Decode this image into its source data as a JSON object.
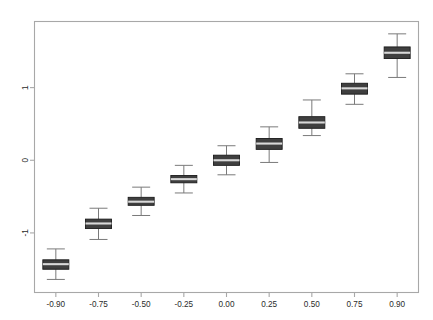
{
  "chart_data": {
    "type": "box",
    "title": "",
    "xlabel": "",
    "ylabel": "",
    "categories": [
      "-0.90",
      "-0.75",
      "-0.50",
      "-0.25",
      "0.00",
      "0.25",
      "0.50",
      "0.75",
      "0.90"
    ],
    "x_tick_labels": [
      "-0.90",
      "-0.75",
      "-0.50",
      "-0.25",
      "0.00",
      "0.25",
      "0.50",
      "0.75",
      "0.90"
    ],
    "y_tick_labels": [
      "1",
      "0",
      "-1"
    ],
    "y_ticks": [
      1,
      0,
      -1
    ],
    "ylim": [
      -1.82,
      1.91
    ],
    "grid": false,
    "legend": false,
    "box_fill": "#3f3f3f",
    "box_edge": "#1a1a1a",
    "median_color": "#d9d9d9",
    "whisker_color": "#7a7a7a",
    "frame_color": "#a8a8a8",
    "background": "#ffffff",
    "boxes": [
      {
        "category": "-0.90",
        "whisker_low": -1.64,
        "q1": -1.5,
        "median": -1.43,
        "q3": -1.37,
        "whisker_high": -1.22
      },
      {
        "category": "-0.75",
        "whisker_low": -1.09,
        "q1": -0.94,
        "median": -0.87,
        "q3": -0.81,
        "whisker_high": -0.66
      },
      {
        "category": "-0.50",
        "whisker_low": -0.76,
        "q1": -0.62,
        "median": -0.57,
        "q3": -0.51,
        "whisker_high": -0.37
      },
      {
        "category": "-0.25",
        "whisker_low": -0.45,
        "q1": -0.31,
        "median": -0.26,
        "q3": -0.21,
        "whisker_high": -0.07
      },
      {
        "category": "0.00",
        "whisker_low": -0.2,
        "q1": -0.07,
        "median": 0.0,
        "q3": 0.07,
        "whisker_high": 0.2
      },
      {
        "category": "0.25",
        "whisker_low": -0.03,
        "q1": 0.15,
        "median": 0.23,
        "q3": 0.3,
        "whisker_high": 0.46
      },
      {
        "category": "0.50",
        "whisker_low": 0.34,
        "q1": 0.44,
        "median": 0.52,
        "q3": 0.6,
        "whisker_high": 0.83
      },
      {
        "category": "0.75",
        "whisker_low": 0.77,
        "q1": 0.91,
        "median": 0.99,
        "q3": 1.06,
        "whisker_high": 1.19
      },
      {
        "category": "0.90",
        "whisker_low": 1.14,
        "q1": 1.4,
        "median": 1.48,
        "q3": 1.56,
        "whisker_high": 1.74
      }
    ]
  }
}
